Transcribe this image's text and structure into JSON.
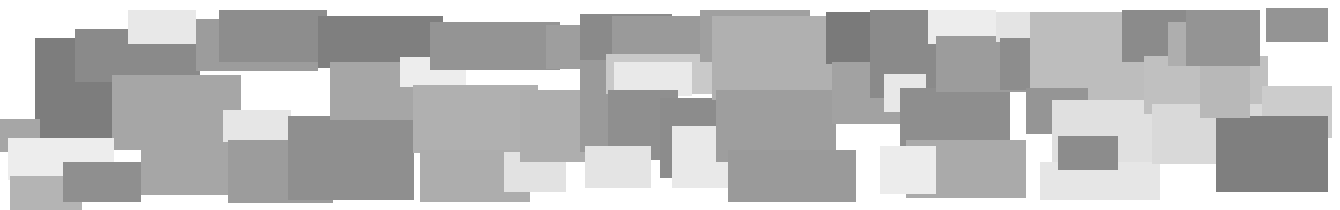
{
  "composition": {
    "title": "Grayscale Rectangle Mosaic",
    "width": 1340,
    "height": 210,
    "background": "#ffffff",
    "description": "Abstract banner of overlapping opaque grayscale rectangles",
    "palette": {
      "white": "#ffffff",
      "near_white": "#f2f2f2",
      "very_light_gray": "#e8e8e8",
      "light_gray": "#d8d8d8",
      "light_mid_gray": "#c8c8c8",
      "mid_gray": "#b4b4b4",
      "gray": "#a6a6a6",
      "mid_dark_gray": "#999999",
      "dark_gray": "#8a8a8a",
      "darker_gray": "#7d7d7d",
      "darkest_gray": "#6e6e6e"
    },
    "rect_count": 62,
    "rects": [
      {
        "id": "r01",
        "x": 35,
        "y": 38,
        "w": 80,
        "h": 112,
        "fill": "#7d7d7d"
      },
      {
        "id": "r02",
        "x": 75,
        "y": 29,
        "w": 125,
        "h": 53,
        "fill": "#8a8a8a"
      },
      {
        "id": "r03",
        "x": 128,
        "y": 10,
        "w": 68,
        "h": 34,
        "fill": "#e8e8e8"
      },
      {
        "id": "r04",
        "x": 112,
        "y": 75,
        "w": 125,
        "h": 75,
        "fill": "#a6a6a6"
      },
      {
        "id": "r05",
        "x": 196,
        "y": 19,
        "w": 122,
        "h": 52,
        "fill": "#9c9c9c"
      },
      {
        "id": "r06",
        "x": 0,
        "y": 119,
        "w": 40,
        "h": 33,
        "fill": "#a6a6a6"
      },
      {
        "id": "r07",
        "x": 8,
        "y": 138,
        "w": 106,
        "h": 42,
        "fill": "#ededed"
      },
      {
        "id": "r08",
        "x": 10,
        "y": 176,
        "w": 72,
        "h": 34,
        "fill": "#b4b4b4"
      },
      {
        "id": "r09",
        "x": 63,
        "y": 162,
        "w": 78,
        "h": 40,
        "fill": "#8f8f8f"
      },
      {
        "id": "r10",
        "x": 141,
        "y": 75,
        "w": 100,
        "h": 120,
        "fill": "#a6a6a6"
      },
      {
        "id": "r11",
        "x": 219,
        "y": 10,
        "w": 108,
        "h": 52,
        "fill": "#8d8d8d"
      },
      {
        "id": "r12",
        "x": 223,
        "y": 110,
        "w": 68,
        "h": 32,
        "fill": "#e6e6e6"
      },
      {
        "id": "r13",
        "x": 228,
        "y": 140,
        "w": 105,
        "h": 63,
        "fill": "#9c9c9c"
      },
      {
        "id": "r14",
        "x": 288,
        "y": 116,
        "w": 126,
        "h": 84,
        "fill": "#8f8f8f"
      },
      {
        "id": "r15",
        "x": 318,
        "y": 16,
        "w": 125,
        "h": 52,
        "fill": "#7f7f7f"
      },
      {
        "id": "r16",
        "x": 330,
        "y": 62,
        "w": 118,
        "h": 58,
        "fill": "#a6a6a6"
      },
      {
        "id": "r17",
        "x": 400,
        "y": 57,
        "w": 66,
        "h": 30,
        "fill": "#ededed"
      },
      {
        "id": "r18",
        "x": 413,
        "y": 85,
        "w": 125,
        "h": 68,
        "fill": "#b0b0b0"
      },
      {
        "id": "r19",
        "x": 430,
        "y": 22,
        "w": 130,
        "h": 48,
        "fill": "#949494"
      },
      {
        "id": "r20",
        "x": 420,
        "y": 150,
        "w": 110,
        "h": 52,
        "fill": "#adadad"
      },
      {
        "id": "r21",
        "x": 504,
        "y": 152,
        "w": 62,
        "h": 40,
        "fill": "#e2e2e2"
      },
      {
        "id": "r22",
        "x": 520,
        "y": 90,
        "w": 88,
        "h": 72,
        "fill": "#aeaeae"
      },
      {
        "id": "r23",
        "x": 546,
        "y": 25,
        "w": 62,
        "h": 44,
        "fill": "#9e9e9e"
      },
      {
        "id": "r24",
        "x": 580,
        "y": 14,
        "w": 92,
        "h": 52,
        "fill": "#8a8a8a"
      },
      {
        "id": "r25",
        "x": 580,
        "y": 60,
        "w": 52,
        "h": 92,
        "fill": "#9a9a9a"
      },
      {
        "id": "r26",
        "x": 606,
        "y": 54,
        "w": 108,
        "h": 40,
        "fill": "#c9c9c9"
      },
      {
        "id": "r27",
        "x": 614,
        "y": 62,
        "w": 78,
        "h": 34,
        "fill": "#e9e9e9"
      },
      {
        "id": "r28",
        "x": 608,
        "y": 90,
        "w": 70,
        "h": 70,
        "fill": "#8f8f8f"
      },
      {
        "id": "r29",
        "x": 612,
        "y": 16,
        "w": 102,
        "h": 38,
        "fill": "#9a9a9a"
      },
      {
        "id": "r30",
        "x": 585,
        "y": 146,
        "w": 66,
        "h": 42,
        "fill": "#e4e4e4"
      },
      {
        "id": "r31",
        "x": 660,
        "y": 98,
        "w": 120,
        "h": 80,
        "fill": "#8c8c8c"
      },
      {
        "id": "r32",
        "x": 672,
        "y": 126,
        "w": 128,
        "h": 62,
        "fill": "#e9e9e9"
      },
      {
        "id": "r33",
        "x": 700,
        "y": 10,
        "w": 110,
        "h": 52,
        "fill": "#a0a0a0"
      },
      {
        "id": "r34",
        "x": 712,
        "y": 16,
        "w": 128,
        "h": 84,
        "fill": "#b0b0b0"
      },
      {
        "id": "r35",
        "x": 716,
        "y": 90,
        "w": 120,
        "h": 72,
        "fill": "#9e9e9e"
      },
      {
        "id": "r36",
        "x": 728,
        "y": 150,
        "w": 128,
        "h": 52,
        "fill": "#9a9a9a"
      },
      {
        "id": "r37",
        "x": 838,
        "y": 34,
        "w": 68,
        "h": 36,
        "fill": "#e6e6e6"
      },
      {
        "id": "r38",
        "x": 826,
        "y": 12,
        "w": 100,
        "h": 52,
        "fill": "#7a7a7a"
      },
      {
        "id": "r39",
        "x": 832,
        "y": 62,
        "w": 84,
        "h": 62,
        "fill": "#a2a2a2"
      },
      {
        "id": "r40",
        "x": 870,
        "y": 10,
        "w": 82,
        "h": 88,
        "fill": "#8a8a8a"
      },
      {
        "id": "r41",
        "x": 884,
        "y": 74,
        "w": 42,
        "h": 38,
        "fill": "#e8e8e8"
      },
      {
        "id": "r42",
        "x": 900,
        "y": 88,
        "w": 110,
        "h": 76,
        "fill": "#8e8e8e"
      },
      {
        "id": "r43",
        "x": 906,
        "y": 140,
        "w": 120,
        "h": 58,
        "fill": "#aaaaaa"
      },
      {
        "id": "r44",
        "x": 928,
        "y": 10,
        "w": 68,
        "h": 34,
        "fill": "#ededed"
      },
      {
        "id": "r45",
        "x": 936,
        "y": 36,
        "w": 96,
        "h": 56,
        "fill": "#9c9c9c"
      },
      {
        "id": "r46",
        "x": 880,
        "y": 146,
        "w": 56,
        "h": 48,
        "fill": "#ececec"
      },
      {
        "id": "r47",
        "x": 996,
        "y": 12,
        "w": 58,
        "h": 30,
        "fill": "#e4e4e4"
      },
      {
        "id": "r48",
        "x": 1000,
        "y": 38,
        "w": 32,
        "h": 52,
        "fill": "#8d8d8d"
      },
      {
        "id": "r49",
        "x": 1030,
        "y": 12,
        "w": 126,
        "h": 94,
        "fill": "#bdbdbd"
      },
      {
        "id": "r50",
        "x": 1026,
        "y": 88,
        "w": 62,
        "h": 46,
        "fill": "#959595"
      },
      {
        "id": "r51",
        "x": 1052,
        "y": 100,
        "w": 116,
        "h": 62,
        "fill": "#e0e0e0"
      },
      {
        "id": "r52",
        "x": 1040,
        "y": 162,
        "w": 120,
        "h": 38,
        "fill": "#e6e6e6"
      },
      {
        "id": "r53",
        "x": 1058,
        "y": 136,
        "w": 60,
        "h": 34,
        "fill": "#8c8c8c"
      },
      {
        "id": "r54",
        "x": 1122,
        "y": 10,
        "w": 94,
        "h": 52,
        "fill": "#8b8b8b"
      },
      {
        "id": "r55",
        "x": 1144,
        "y": 56,
        "w": 124,
        "h": 58,
        "fill": "#c0c0c0"
      },
      {
        "id": "r56",
        "x": 1152,
        "y": 104,
        "w": 126,
        "h": 60,
        "fill": "#d9d9d9"
      },
      {
        "id": "r57",
        "x": 1168,
        "y": 22,
        "w": 68,
        "h": 44,
        "fill": "#aeaeae"
      },
      {
        "id": "r58",
        "x": 1186,
        "y": 10,
        "w": 74,
        "h": 56,
        "fill": "#949494"
      },
      {
        "id": "r59",
        "x": 1266,
        "y": 8,
        "w": 62,
        "h": 34,
        "fill": "#949494"
      },
      {
        "id": "r60",
        "x": 1262,
        "y": 86,
        "w": 70,
        "h": 52,
        "fill": "#cccccc"
      },
      {
        "id": "r61",
        "x": 1216,
        "y": 116,
        "w": 112,
        "h": 76,
        "fill": "#7f7f7f"
      },
      {
        "id": "r62",
        "x": 1200,
        "y": 66,
        "w": 50,
        "h": 52,
        "fill": "#b8b8b8"
      }
    ]
  }
}
